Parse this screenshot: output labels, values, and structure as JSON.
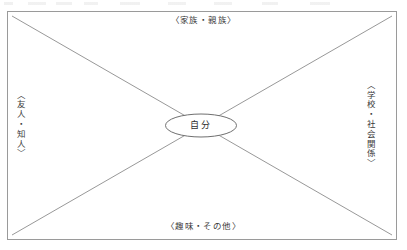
{
  "diagram": {
    "type": "four-quadrant-relationship-map",
    "center_node": {
      "label": "自分",
      "shape": "ellipse"
    },
    "quadrant_labels": {
      "top": "〈家族・親族〉",
      "right": "〈学校・社会関係〉",
      "bottom": "〈趣味・その他〉",
      "left": "〈友人・知人〉"
    },
    "frame": {
      "shape": "rectangle",
      "divider": "two-diagonals"
    },
    "colors": {
      "line": "#8c8c8c",
      "frame": "#9a9a9a",
      "text": "#3b3b3b",
      "background": "#ffffff"
    }
  }
}
